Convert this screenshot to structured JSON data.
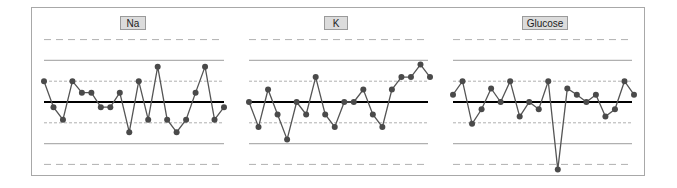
{
  "chart_data": [
    {
      "type": "line",
      "title": "Na",
      "xlabel": "",
      "ylabel": "",
      "x": [
        1,
        2,
        3,
        4,
        5,
        6,
        7,
        8,
        9,
        10,
        11,
        12,
        13,
        14,
        15,
        16,
        17,
        18,
        19,
        20
      ],
      "values_sd": [
        1.0,
        -0.25,
        -0.85,
        1.0,
        0.45,
        0.45,
        -0.25,
        -0.25,
        0.45,
        -1.45,
        1.0,
        -0.85,
        1.7,
        -0.85,
        -1.45,
        -0.85,
        0.45,
        1.7,
        -0.85,
        -0.25
      ],
      "reference_lines": {
        "mean": 0,
        "plus_1sd": 1,
        "minus_1sd": -1,
        "plus_2sd": 2,
        "minus_2sd": -2,
        "plus_3sd": 3,
        "minus_3sd": -3
      },
      "ylim": [
        -3.5,
        3.5
      ],
      "grid": false
    },
    {
      "type": "line",
      "title": "K",
      "xlabel": "",
      "ylabel": "",
      "x": [
        1,
        2,
        3,
        4,
        5,
        6,
        7,
        8,
        9,
        10,
        11,
        12,
        13,
        14,
        15,
        16,
        17,
        18,
        19,
        20
      ],
      "values_sd": [
        0,
        -1.2,
        0.6,
        -0.6,
        -1.8,
        0,
        -0.6,
        1.2,
        -0.6,
        -1.2,
        0,
        0,
        0.6,
        -0.6,
        -1.2,
        0.6,
        1.2,
        1.2,
        1.8,
        1.2
      ],
      "reference_lines": {
        "mean": 0,
        "plus_1sd": 1,
        "minus_1sd": -1,
        "plus_2sd": 2,
        "minus_2sd": -2,
        "plus_3sd": 3,
        "minus_3sd": -3
      },
      "ylim": [
        -3.5,
        3.5
      ],
      "grid": false
    },
    {
      "type": "line",
      "title": "Glucose",
      "xlabel": "",
      "ylabel": "",
      "x": [
        1,
        2,
        3,
        4,
        5,
        6,
        7,
        8,
        9,
        10,
        11,
        12,
        13,
        14,
        15,
        16,
        17,
        18,
        19,
        20
      ],
      "values_sd": [
        0.35,
        1.0,
        -1.05,
        -0.35,
        0.65,
        0,
        1.0,
        -0.7,
        0,
        -0.35,
        1.0,
        -3.25,
        0.65,
        0.35,
        0,
        0.35,
        -0.7,
        -0.35,
        1.0,
        0.35
      ],
      "reference_lines": {
        "mean": 0,
        "plus_1sd": 1,
        "minus_1sd": -1,
        "plus_2sd": 2,
        "minus_2sd": -2,
        "plus_3sd": 3,
        "minus_3sd": -3
      },
      "ylim": [
        -3.5,
        3.5
      ],
      "grid": false
    }
  ],
  "panels": [
    {
      "title": "Na"
    },
    {
      "title": "K"
    },
    {
      "title": "Glucose"
    }
  ],
  "colors": {
    "series": "#555555",
    "marker": "#4a4a4a",
    "mean_line": "#000000",
    "sd_line": "#b0b0b0",
    "frame": "#a8a8a8",
    "badge_bg": "#dcdcdc"
  }
}
